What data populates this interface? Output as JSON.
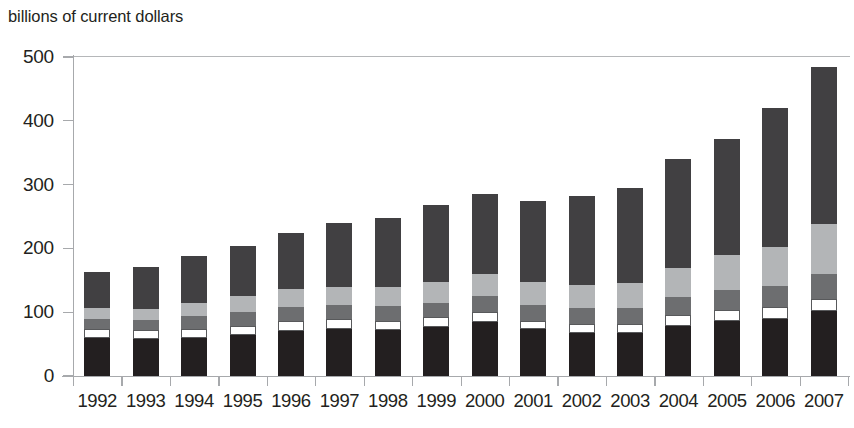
{
  "chart_title": "billions of current dollars",
  "axis": {
    "y_ticks": [
      "0",
      "100",
      "200",
      "300",
      "400",
      "500"
    ],
    "y_min": 0,
    "y_max": 500,
    "y_step": 100
  },
  "chart_data": {
    "type": "bar",
    "stacked": true,
    "title": "billions of current dollars",
    "xlabel": "",
    "ylabel": "billions of current dollars",
    "ylim": [
      0,
      500
    ],
    "yticks": [
      0,
      100,
      200,
      300,
      400,
      500
    ],
    "grid": false,
    "legend": "none",
    "categories": [
      "1992",
      "1993",
      "1994",
      "1995",
      "1996",
      "1997",
      "1998",
      "1999",
      "2000",
      "2001",
      "2002",
      "2003",
      "2004",
      "2005",
      "2006",
      "2007"
    ],
    "series": [
      {
        "name": "segment-1-black",
        "color": "#231f20",
        "values": [
          60,
          58,
          60,
          65,
          71,
          73,
          72,
          77,
          85,
          73,
          68,
          67,
          79,
          86,
          90,
          102
        ]
      },
      {
        "name": "segment-2-white",
        "color": "#ffffff",
        "values": [
          13,
          14,
          14,
          14,
          15,
          16,
          15,
          15,
          15,
          14,
          14,
          15,
          17,
          17,
          18,
          19
        ]
      },
      {
        "name": "segment-3-mid-gray",
        "color": "#6d6e70",
        "values": [
          17,
          16,
          20,
          22,
          22,
          22,
          22,
          23,
          25,
          24,
          24,
          25,
          28,
          32,
          33,
          39
        ]
      },
      {
        "name": "segment-4-light-gray",
        "color": "#b3b5b7",
        "values": [
          16,
          17,
          21,
          25,
          28,
          29,
          30,
          33,
          35,
          36,
          37,
          39,
          45,
          55,
          62,
          79
        ]
      },
      {
        "name": "segment-5-dark-gray",
        "color": "#414042",
        "values": [
          57,
          66,
          73,
          78,
          88,
          100,
          108,
          120,
          126,
          128,
          139,
          148,
          171,
          181,
          217,
          246
        ]
      }
    ],
    "totals": [
      163,
      171,
      188,
      204,
      224,
      240,
      247,
      268,
      286,
      275,
      282,
      294,
      340,
      371,
      420,
      485
    ]
  }
}
